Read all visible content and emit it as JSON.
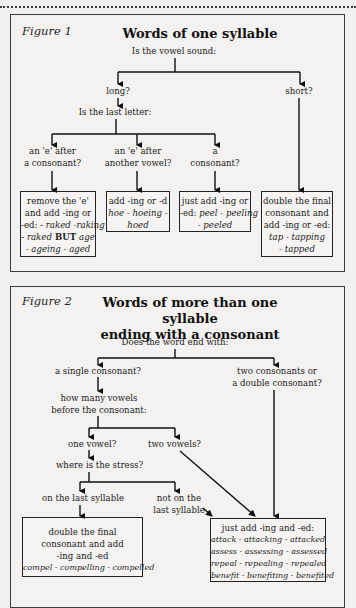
{
  "figure1": {
    "label": "Figure 1",
    "title": "Words of one syllable",
    "question": "Is the vowel sound:",
    "branch_long": "long?",
    "branch_short": "short?",
    "last_letter_question": "Is the last letter:",
    "options": [
      {
        "line1": "an 'e' after",
        "line2": "a consonant?"
      },
      {
        "line1": "an 'e' after",
        "line2": "another vowel?"
      },
      {
        "line1": "a",
        "line2": "consonant?"
      }
    ],
    "boxes": [
      {
        "lines": [
          "remove the 'e'",
          "and add -ing or"
        ],
        "line3_plain": "-ed: - ",
        "line3_ex": "raked -raking",
        "line4_pre": "- ",
        "line4_ex1": "raked",
        "line4_bold": " BUT ",
        "line4_ex2": "age",
        "line5_ex": "- ageing - aged"
      },
      {
        "line1": "add -ing or -d",
        "line2_ex": "hoe - hoeing -",
        "line3_ex": "hoed"
      },
      {
        "line1": "just add -ing or",
        "line2_plain": "-ed: ",
        "line2_ex": "peel - peeling",
        "line3_ex": "- peeled"
      },
      {
        "line1": "double the final",
        "line2": "consonant and",
        "line3": "add -ing or -ed:",
        "line4_ex": "tap - tapping",
        "line5_ex": "- tapped"
      }
    ]
  },
  "figure2": {
    "label": "Figure 2",
    "title_line1": "Words of more than one syllable",
    "title_line2": "ending with a consonant",
    "question": "Does the word end with:",
    "branch_single": "a single consonant?",
    "branch_double_line1": "two consonants or",
    "branch_double_line2": "a double consonant?",
    "vowels_q_line1": "how many vowels",
    "vowels_q_line2": "before the consonant:",
    "one_vowel": "one vowel?",
    "two_vowels": "two vowels?",
    "stress_q": "where is the stress?",
    "stress_last": "on the last syllable",
    "stress_not_line1": "not on the",
    "stress_not_line2": "last syllable",
    "box_double": {
      "line1": "double the final",
      "line2": "consonant and add",
      "line3": "-ing and -ed",
      "line4_ex": "compel - compelling - compelled"
    },
    "box_just": {
      "line1": "just add -ing and -ed:",
      "examples": [
        "attack - attacking - attacked",
        "assess - assessing - assessed",
        "repeal - repealing - repealed",
        "benefit - benefiting - benefited"
      ]
    }
  }
}
